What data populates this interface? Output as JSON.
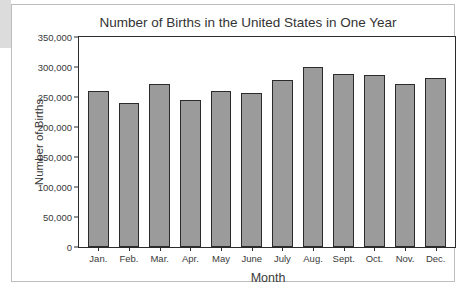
{
  "page": {
    "background_color": "#ffffff",
    "card_border_color": "#bdbdbd",
    "left_strip_color": "#dcdcdc"
  },
  "chart_data": {
    "type": "bar",
    "title": "Number of Births in the United States in One Year",
    "xlabel": "Month",
    "ylabel": "Number of Births",
    "categories": [
      "Jan.",
      "Feb.",
      "Mar.",
      "Apr.",
      "May",
      "June",
      "July",
      "Aug.",
      "Sept.",
      "Oct.",
      "Nov.",
      "Dec."
    ],
    "values": [
      260000,
      240000,
      272000,
      245000,
      260000,
      256000,
      278000,
      300000,
      288000,
      286000,
      272000,
      281000
    ],
    "ylim": [
      0,
      350000
    ],
    "ytick_values": [
      350000,
      300000,
      250000,
      200000,
      150000,
      100000,
      50000,
      0
    ],
    "ytick_labels": [
      "350,000",
      "300,000",
      "250,000",
      "200,000",
      "150,000",
      "100,000",
      "50,000",
      "0"
    ],
    "grid": false,
    "legend": null,
    "bar_fill_color": "#9b9b9b",
    "bar_edge_color": "#2b2b2b",
    "axis_color": "#2b2b2b"
  }
}
